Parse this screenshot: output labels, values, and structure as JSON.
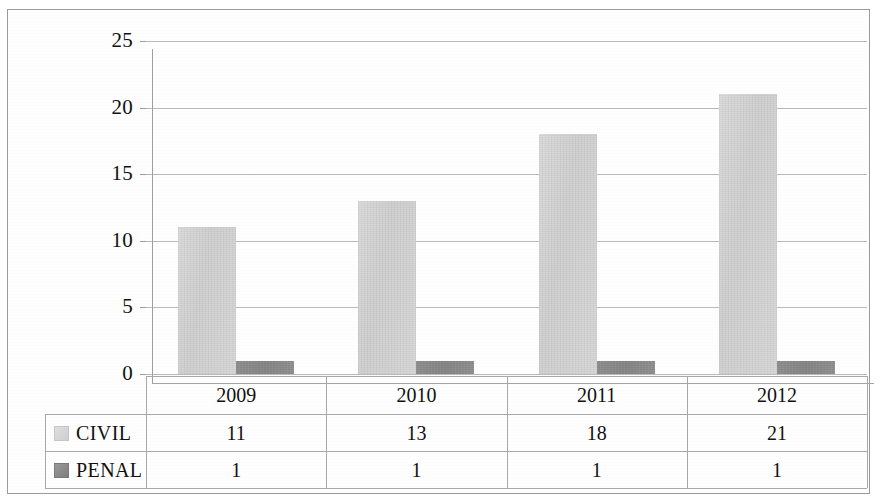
{
  "chart_data": {
    "type": "bar",
    "title": "",
    "xlabel": "",
    "ylabel": "",
    "categories": [
      "2009",
      "2010",
      "2011",
      "2012"
    ],
    "series": [
      {
        "name": "CIVIL",
        "values": [
          11,
          13,
          18,
          21
        ],
        "color": "#d4d4d4"
      },
      {
        "name": "PENAL",
        "values": [
          1,
          1,
          1,
          1
        ],
        "color": "#8a8a8a"
      }
    ],
    "ylim": [
      0,
      25
    ],
    "yticks": [
      0,
      5,
      10,
      15,
      20,
      25
    ],
    "ytick_labels": [
      "0",
      "5",
      "10",
      "15",
      "20",
      "25"
    ],
    "grid": true,
    "legend_position": "bottom-table"
  },
  "axis": {
    "y_ticks": [
      "25",
      "20",
      "15",
      "10",
      "5",
      "0"
    ]
  },
  "table": {
    "column_headers": [
      "2009",
      "2010",
      "2011",
      "2012"
    ],
    "rows": [
      {
        "label": "CIVIL",
        "swatch": "civil-legend-swatch",
        "values": [
          "11",
          "13",
          "18",
          "21"
        ]
      },
      {
        "label": "PENAL",
        "swatch": "penal-legend-swatch",
        "values": [
          "1",
          "1",
          "1",
          "1"
        ]
      }
    ]
  },
  "colors": {
    "civil": "#d4d4d4",
    "penal": "#8a8a8a",
    "grid": "#b9b9b9",
    "border": "#9a9a9a"
  }
}
